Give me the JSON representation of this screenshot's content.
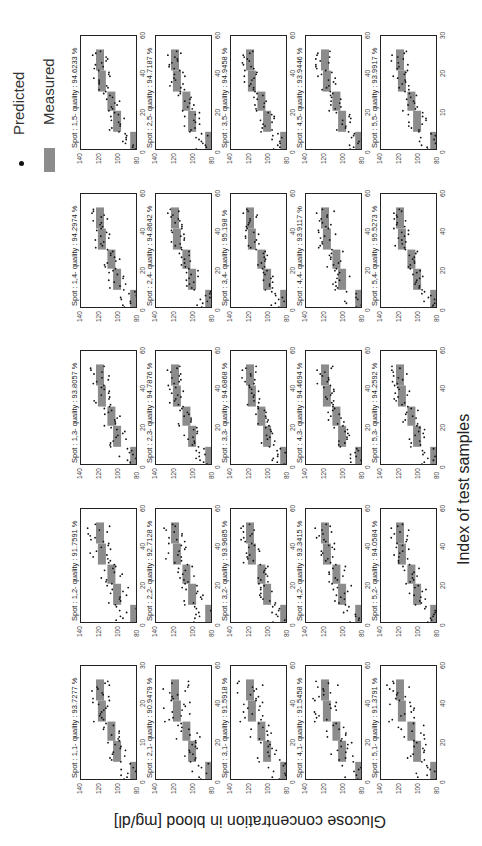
{
  "chart_data": {
    "type": "scatter",
    "layout": "5x5 grid of subplots, figure rotated 90 degrees counter-clockwise",
    "xlabel": "Index of test samples",
    "ylabel": "Glucose concentration in blood [mg/dl]",
    "legend": [
      {
        "label": "Predicted",
        "marker": "dot",
        "color": "#111111"
      },
      {
        "label": "Measured",
        "marker": "bar",
        "color": "#8c8c8c"
      }
    ],
    "xlim": [
      0,
      60
    ],
    "ylim": [
      80,
      140
    ],
    "xticks": [
      0,
      20,
      40,
      60
    ],
    "yticks": [
      80,
      100,
      120,
      140
    ],
    "panels": [
      {
        "spot": "1,1",
        "title": "Spot : 1,1- quality : 93.7277 %",
        "quality": 93.7277,
        "xticks": [
          0,
          10,
          20,
          30
        ],
        "xlim": [
          0,
          30
        ]
      },
      {
        "spot": "2,1",
        "title": "Spot : 2,1- quality : 90.9479 %",
        "quality": 90.9479
      },
      {
        "spot": "3,1",
        "title": "Spot : 3,1- quality : 91.5918 %",
        "quality": 91.5918
      },
      {
        "spot": "4,1",
        "title": "Spot : 4,1- quality : 91.5458 %",
        "quality": 91.5458
      },
      {
        "spot": "5,1",
        "title": "Spot : 5,1- quality : 91.3791 %",
        "quality": 91.3791
      },
      {
        "spot": "1,2",
        "title": "Spot : 1,2- quality : 91.7591 %",
        "quality": 91.7591
      },
      {
        "spot": "2,2",
        "title": "Spot : 2,2- quality : 92.7128 %",
        "quality": 92.7128
      },
      {
        "spot": "3,2",
        "title": "Spot : 3,2- quality : 93.9685 %",
        "quality": 93.9685
      },
      {
        "spot": "4,2",
        "title": "Spot : 4,2- quality : 93.3415 %",
        "quality": 93.3415
      },
      {
        "spot": "5,2",
        "title": "Spot : 5,2- quality : 94.0584 %",
        "quality": 94.0584
      },
      {
        "spot": "1,3",
        "title": "Spot : 1,3- quality : 93.8057 %",
        "quality": 93.8057
      },
      {
        "spot": "2,3",
        "title": "Spot : 2,3- quality : 94.7876 %",
        "quality": 94.7876
      },
      {
        "spot": "3,3",
        "title": "Spot : 3,3- quality : 94.6868 %",
        "quality": 94.6868
      },
      {
        "spot": "4,3",
        "title": "Spot : 4,3- quality : 94.4694 %",
        "quality": 94.4694
      },
      {
        "spot": "5,3",
        "title": "Spot : 5,3- quality : 94.2592 %",
        "quality": 94.2592
      },
      {
        "spot": "1,4",
        "title": "Spot : 1,4- quality : 94.2974 %",
        "quality": 94.2974
      },
      {
        "spot": "2,4",
        "title": "Spot : 2,4- quality : 94.8642 %",
        "quality": 94.8642
      },
      {
        "spot": "3,4",
        "title": "Spot : 3,4- quality : 95.198 %",
        "quality": 95.198
      },
      {
        "spot": "4,4",
        "title": "Spot : 4,4- quality : 93.9117 %",
        "quality": 93.9117
      },
      {
        "spot": "5,4",
        "title": "Spot : 5,4- quality : 95.5273 %",
        "quality": 95.5273
      },
      {
        "spot": "1,5",
        "title": "Spot : 1,5- quality : 94.6233 %",
        "quality": 94.6233
      },
      {
        "spot": "2,5",
        "title": "Spot : 2,5- quality : 94.7187 %",
        "quality": 94.7187
      },
      {
        "spot": "3,5",
        "title": "Spot : 3,5- quality : 94.9458 %",
        "quality": 94.9458
      },
      {
        "spot": "4,5",
        "title": "Spot : 4,5- quality : 93.9446 %",
        "quality": 93.9446,
        "xticks": [
          0,
          20,
          40,
          60
        ]
      },
      {
        "spot": "5,5",
        "title": "Spot : 5,5- quality : 93.9917 %",
        "quality": 93.9917,
        "xticks": [
          0,
          10,
          20,
          30
        ],
        "xlim": [
          0,
          30
        ]
      }
    ],
    "measured_steps_typical": [
      {
        "x_range": [
          0,
          10
        ],
        "y": 84
      },
      {
        "x_range": [
          10,
          21
        ],
        "y": 102
      },
      {
        "x_range": [
          21,
          31
        ],
        "y": 108
      },
      {
        "x_range": [
          31,
          42
        ],
        "y": 118
      },
      {
        "x_range": [
          42,
          53
        ],
        "y": 120
      }
    ]
  },
  "legend": {
    "predicted": "Predicted",
    "measured": "Measured"
  },
  "axes": {
    "x_title": "Index of test samples",
    "y_title": "Glucose concentration in blood [mg/dl]"
  }
}
